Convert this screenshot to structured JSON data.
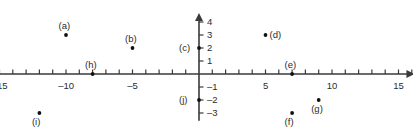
{
  "figure": {
    "type": "coordinate-plane",
    "origin_px": [
      199,
      74
    ],
    "px_per_unit_x": 13.3,
    "px_per_unit_y": 13.0,
    "axis_color": "#3a3a3a",
    "point_color": "#111111",
    "background": "#ffffff"
  },
  "x_axis": {
    "name": "x-axis",
    "min": -15.6,
    "max": 16.2,
    "arrow": "right",
    "tick_step": 1,
    "tick_min": -15,
    "tick_max": 16,
    "labels": [
      {
        "value": -15,
        "text": "–15"
      },
      {
        "value": -10,
        "text": "–10"
      },
      {
        "value": -5,
        "text": "–5"
      },
      {
        "value": 5,
        "text": "5"
      },
      {
        "value": 10,
        "text": "10"
      },
      {
        "value": 15,
        "text": "15"
      }
    ]
  },
  "y_axis": {
    "name": "y-axis",
    "min": -3.6,
    "max": 4.7,
    "arrow": "up",
    "tick_step": 1,
    "tick_min": -3,
    "tick_max": 4,
    "labels": [
      {
        "value": 4,
        "text": "4"
      },
      {
        "value": 3,
        "text": "3"
      },
      {
        "value": 2,
        "text": "2"
      },
      {
        "value": 1,
        "text": "1"
      },
      {
        "value": -1,
        "text": "–1"
      },
      {
        "value": -2,
        "text": "–2"
      },
      {
        "value": -3,
        "text": "–3"
      }
    ]
  },
  "chart_data": {
    "type": "scatter",
    "title": "",
    "xlabel": "",
    "ylabel": "",
    "xlim": [
      -15.6,
      16.2
    ],
    "ylim": [
      -3.6,
      4.7
    ],
    "grid": false,
    "legend": false,
    "points": [
      {
        "id": "a",
        "label": "(a)",
        "x": -10,
        "y": 3,
        "label_pos": "above"
      },
      {
        "id": "b",
        "label": "(b)",
        "x": -5,
        "y": 2,
        "label_pos": "above"
      },
      {
        "id": "c",
        "label": "(c)",
        "x": 0,
        "y": 2,
        "label_pos": "left"
      },
      {
        "id": "d",
        "label": "(d)",
        "x": 5,
        "y": 3,
        "label_pos": "right"
      },
      {
        "id": "e",
        "label": "(e)",
        "x": 7,
        "y": 0,
        "label_pos": "above"
      },
      {
        "id": "f",
        "label": "(f)",
        "x": 7,
        "y": -3,
        "label_pos": "below"
      },
      {
        "id": "g",
        "label": "(g)",
        "x": 9,
        "y": -2,
        "label_pos": "below"
      },
      {
        "id": "h",
        "label": "(h)",
        "x": -8,
        "y": 0,
        "label_pos": "above"
      },
      {
        "id": "i",
        "label": "(i)",
        "x": -12,
        "y": -3,
        "label_pos": "below"
      },
      {
        "id": "j",
        "label": "(j)",
        "x": 0,
        "y": -2,
        "label_pos": "left"
      }
    ]
  }
}
